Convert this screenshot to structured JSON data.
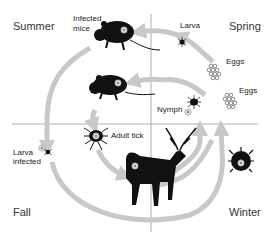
{
  "diagram": {
    "seasons": {
      "top_left": "Summer",
      "top_right": "Spring",
      "bottom_left": "Fall",
      "bottom_right": "Winter"
    },
    "labels": {
      "infected_mice_1": "Infected",
      "infected_mice_2": "mice",
      "larva": "Larva",
      "eggs_1": "Eggs",
      "eggs_2": "Eggs",
      "nymph": "Nymph",
      "adult_tick": "Adult tick",
      "larva_infected_1": "Larva",
      "larva_infected_2": "infected"
    },
    "colors": {
      "arrow": "#c8c8c8",
      "grid": "#999999",
      "silhouette": "#111111",
      "pathogen": "#dddddd"
    },
    "icons": [
      "mouse-icon",
      "mouse-icon",
      "larva-tick-icon",
      "eggs-icon",
      "eggs-icon",
      "nymph-tick-icon",
      "adult-tick-icon",
      "deer-icon",
      "engorged-tick-icon",
      "infected-larva-icon"
    ]
  }
}
